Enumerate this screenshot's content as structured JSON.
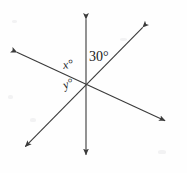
{
  "figure": {
    "kind": "intersecting-lines-angle-diagram",
    "background_color": "#fefefe",
    "stroke_color": "#3a3a3a",
    "text_color": "#1a1a1a",
    "stroke_width": 1.1,
    "width": 187,
    "height": 173,
    "intersection": {
      "x": 86,
      "y": 85
    },
    "lines": [
      {
        "name": "vertical-line",
        "x1": 86,
        "y1": 16,
        "x2": 86,
        "y2": 158,
        "arrow_start": true,
        "arrow_end": true
      },
      {
        "name": "rising-diagonal-line",
        "x1": 145,
        "y1": 25,
        "x2": 23,
        "y2": 149,
        "arrow_start": true,
        "arrow_end": true
      },
      {
        "name": "shallow-diagonal-line",
        "x1": 14,
        "y1": 51,
        "x2": 168,
        "y2": 122,
        "arrow_start": true,
        "arrow_end": true
      }
    ],
    "labels": {
      "angle_30": {
        "text": "30",
        "degree_symbol": "°",
        "full": "30°"
      },
      "angle_x": {
        "text": "x",
        "degree_symbol": "°",
        "full": "x°"
      },
      "angle_y": {
        "text": "y",
        "degree_symbol": "°",
        "full": "y°"
      }
    }
  },
  "chart_data": {
    "type": "diagram",
    "title": "",
    "vertex": {
      "x": 86,
      "y": 85
    },
    "rays": [
      {
        "name": "up",
        "angle_deg": 90
      },
      {
        "name": "up-right",
        "angle_deg": 60
      },
      {
        "name": "right-slightly-down",
        "angle_deg": -25
      },
      {
        "name": "down",
        "angle_deg": 270
      },
      {
        "name": "down-left",
        "angle_deg": 240
      },
      {
        "name": "left-slightly-up",
        "angle_deg": 155
      }
    ],
    "labeled_angles": [
      {
        "label": "30°",
        "value": 30,
        "between": [
          "up",
          "up-right"
        ]
      },
      {
        "label": "x°",
        "value": null,
        "between": [
          "up",
          "left-slightly-up"
        ]
      },
      {
        "label": "y°",
        "value": null,
        "between": [
          "left-slightly-up",
          "down-left"
        ]
      }
    ]
  }
}
